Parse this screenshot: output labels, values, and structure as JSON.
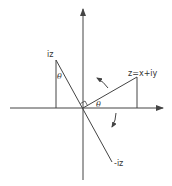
{
  "diagram": {
    "title": "",
    "colors": {
      "line": "#444444",
      "background": "#ffffff",
      "text": "#333333"
    },
    "origin": [
      83,
      108
    ],
    "axes": {
      "horizontal": {
        "from": [
          10,
          108
        ],
        "to": [
          163,
          108
        ],
        "arrow": "right"
      },
      "vertical": {
        "from": [
          83,
          180
        ],
        "to": [
          83,
          9
        ],
        "arrow": "up"
      }
    },
    "points": [
      {
        "id": "z",
        "label": "z=x+iy",
        "pos": [
          137,
          77
        ]
      },
      {
        "id": "iz",
        "label": "iz",
        "pos": [
          56,
          60
        ]
      },
      {
        "id": "neg_iz",
        "label": "-iz",
        "pos": [
          112,
          162
        ]
      }
    ],
    "angle_labels": {
      "theta_z": "θ",
      "theta_iz": "θ"
    },
    "rotation_arrows": [
      {
        "id": "counterclockwise",
        "direction": "up-left"
      },
      {
        "id": "clockwise",
        "direction": "down-left"
      }
    ],
    "right_angle_marker": true
  }
}
